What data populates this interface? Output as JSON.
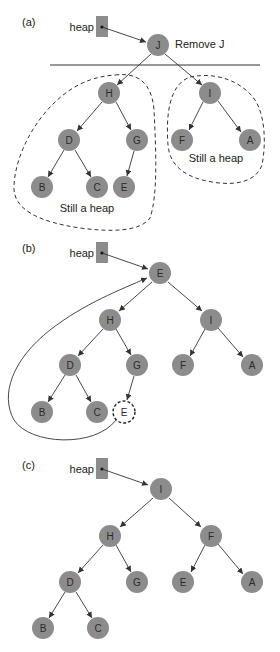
{
  "panels": [
    {
      "id": "a",
      "label": "(a)",
      "heap_label": "heap",
      "annotation": "Remove J",
      "regions": [
        "Still a heap",
        "Still a heap"
      ],
      "nodes": {
        "J": "J",
        "H": "H",
        "I": "I",
        "D": "D",
        "G": "G",
        "F": "F",
        "A": "A",
        "B": "B",
        "C": "C",
        "E": "E"
      }
    },
    {
      "id": "b",
      "label": "(b)",
      "heap_label": "heap",
      "nodes": {
        "E": "E",
        "H": "H",
        "I": "I",
        "D": "D",
        "G": "G",
        "F": "F",
        "A": "A",
        "B": "B",
        "C": "C",
        "E2": "E"
      }
    },
    {
      "id": "c",
      "label": "(c)",
      "heap_label": "heap",
      "nodes": {
        "I": "I",
        "H": "H",
        "F": "F",
        "D": "D",
        "G": "G",
        "E": "E",
        "A": "A",
        "B": "B",
        "C": "C"
      }
    }
  ],
  "colors": {
    "node_fill": "#8c8c8c",
    "edge": "#333333",
    "background": "#ffffff"
  }
}
